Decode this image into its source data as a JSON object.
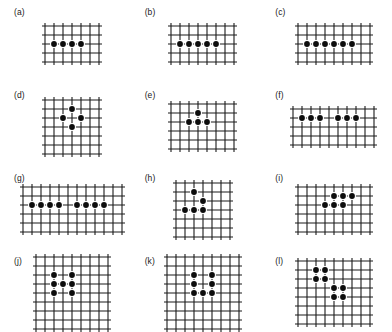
{
  "figure": {
    "background_color": "#ffffff",
    "grid_line_color": "#1a1a1a",
    "dot_color": "#0d0d0d",
    "dot_halo_color": "#ffffff",
    "cell_size": 9,
    "grid_line_width": 1.1,
    "dot_radius": 2.9,
    "dot_halo_radius": 4.0
  },
  "panels": [
    {
      "id": "a",
      "label": "(a)",
      "cols": 6,
      "rows": 4,
      "dots": [
        [
          1,
          2
        ],
        [
          2,
          2
        ],
        [
          3,
          2
        ],
        [
          4,
          2
        ]
      ],
      "dot_count": 4
    },
    {
      "id": "b",
      "label": "(b)",
      "cols": 7,
      "rows": 4,
      "dots": [
        [
          1,
          2
        ],
        [
          2,
          2
        ],
        [
          3,
          2
        ],
        [
          4,
          2
        ],
        [
          5,
          2
        ]
      ],
      "dot_count": 5
    },
    {
      "id": "c",
      "label": "(c)",
      "cols": 8,
      "rows": 4,
      "dots": [
        [
          1,
          2
        ],
        [
          2,
          2
        ],
        [
          3,
          2
        ],
        [
          4,
          2
        ],
        [
          5,
          2
        ],
        [
          6,
          2
        ]
      ],
      "dot_count": 6
    },
    {
      "id": "d",
      "label": "(d)",
      "cols": 6,
      "rows": 6,
      "dots": [
        [
          3,
          1
        ],
        [
          2,
          2
        ],
        [
          4,
          2
        ],
        [
          3,
          3
        ]
      ],
      "dot_count": 4
    },
    {
      "id": "e",
      "label": "(e)",
      "cols": 7,
      "rows": 5,
      "dots": [
        [
          3,
          1
        ],
        [
          2,
          2
        ],
        [
          3,
          2
        ],
        [
          4,
          2
        ]
      ],
      "dot_count": 4
    },
    {
      "id": "f",
      "label": "(f)",
      "cols": 9,
      "rows": 4,
      "dots": [
        [
          1,
          1
        ],
        [
          2,
          1
        ],
        [
          3,
          1
        ],
        [
          5,
          1
        ],
        [
          6,
          1
        ],
        [
          7,
          1
        ]
      ],
      "dot_count": 6
    },
    {
      "id": "g",
      "label": "(g)",
      "cols": 11,
      "rows": 5,
      "dots": [
        [
          1,
          2
        ],
        [
          2,
          2
        ],
        [
          3,
          2
        ],
        [
          4,
          2
        ],
        [
          6,
          2
        ],
        [
          7,
          2
        ],
        [
          8,
          2
        ],
        [
          9,
          2
        ]
      ],
      "dot_count": 8
    },
    {
      "id": "h",
      "label": "(h)",
      "cols": 6,
      "rows": 6,
      "dots": [
        [
          2,
          1
        ],
        [
          3,
          2
        ],
        [
          1,
          3
        ],
        [
          2,
          3
        ],
        [
          3,
          3
        ]
      ],
      "dot_count": 5
    },
    {
      "id": "i",
      "label": "(i)",
      "cols": 8,
      "rows": 5,
      "dots": [
        [
          4,
          1
        ],
        [
          5,
          1
        ],
        [
          6,
          1
        ],
        [
          3,
          2
        ],
        [
          4,
          2
        ],
        [
          5,
          2
        ]
      ],
      "dot_count": 6
    },
    {
      "id": "j",
      "label": "(j)",
      "cols": 8,
      "rows": 8,
      "dots": [
        [
          2,
          2
        ],
        [
          4,
          2
        ],
        [
          2,
          3
        ],
        [
          3,
          3
        ],
        [
          4,
          3
        ],
        [
          2,
          4
        ],
        [
          4,
          4
        ]
      ],
      "dot_count": 7
    },
    {
      "id": "k",
      "label": "(k)",
      "cols": 8,
      "rows": 8,
      "dots": [
        [
          3,
          2
        ],
        [
          5,
          2
        ],
        [
          3,
          3
        ],
        [
          5,
          3
        ],
        [
          3,
          4
        ],
        [
          4,
          4
        ],
        [
          5,
          4
        ]
      ],
      "dot_count": 7
    },
    {
      "id": "l",
      "label": "(l)",
      "cols": 8,
      "rows": 7,
      "dots": [
        [
          2,
          1
        ],
        [
          3,
          1
        ],
        [
          2,
          2
        ],
        [
          3,
          2
        ],
        [
          4,
          3
        ],
        [
          5,
          3
        ],
        [
          4,
          4
        ],
        [
          5,
          4
        ]
      ],
      "dot_count": 8
    }
  ]
}
